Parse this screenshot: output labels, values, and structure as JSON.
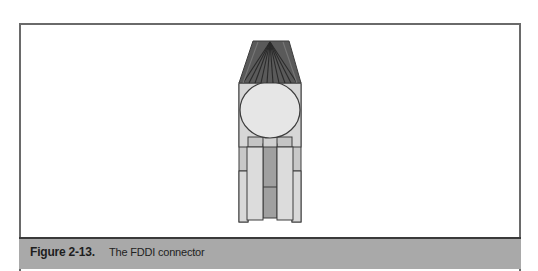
{
  "figure": {
    "label": "Figure 2-13.",
    "caption": "The FDDI connector"
  },
  "diagram": {
    "subject": "FDDI connector",
    "colors": {
      "frame": "#6a6a6a",
      "caption_bg": "#a9a9a9",
      "cap_dark": "#5a5a5a",
      "cap_stripe": "#2a2a2a",
      "body_light": "#d6d6d6",
      "circle": "#e6e6e6",
      "prong_light": "#dcdcdc",
      "center_dark": "#a0a0a0",
      "outline": "#3c3c3c"
    }
  }
}
